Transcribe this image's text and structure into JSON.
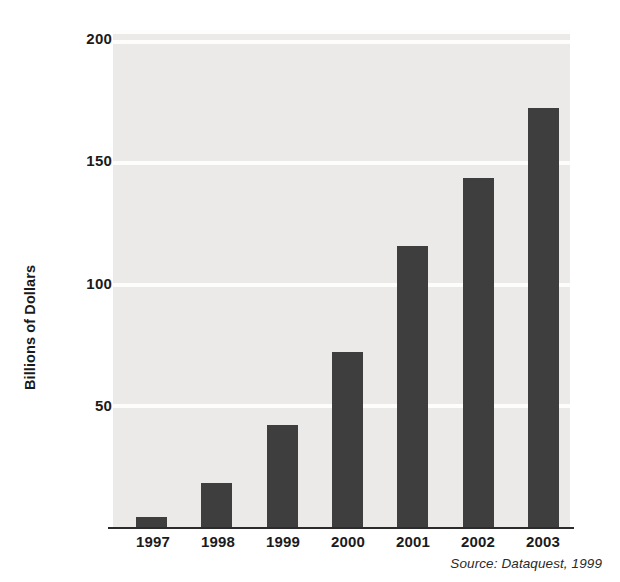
{
  "chart_data": {
    "type": "bar",
    "title": "",
    "subtitle": "",
    "xlabel": "",
    "ylabel": "Billions of Dollars",
    "categories": [
      "1997",
      "1998",
      "1999",
      "2000",
      "2001",
      "2002",
      "2003"
    ],
    "values": [
      4,
      18,
      42,
      72,
      116,
      144,
      173
    ],
    "series": [
      {
        "name": "Billions of Dollars",
        "values": [
          4,
          18,
          42,
          72,
          116,
          144,
          173
        ]
      }
    ],
    "ylim": [
      0,
      205
    ],
    "yticks": [
      50,
      100,
      150,
      200
    ],
    "ytick_labels": [
      "50",
      "100",
      "150",
      "200"
    ],
    "xtick_labels": [
      "1997",
      "1998",
      "1999",
      "2000",
      "2001",
      "2002",
      "2003"
    ],
    "grid": true,
    "grid_axis": "y",
    "grid_color": "#fdfdfc",
    "legend": false,
    "legend_position": "none",
    "bar_color": "#3f3e3e",
    "plot_background": "#ebeae8",
    "axis_color": "#2b2b2b",
    "annotations": [
      "Source: Dataquest, 1999"
    ]
  },
  "source_note": "Source: Dataquest, 1999"
}
